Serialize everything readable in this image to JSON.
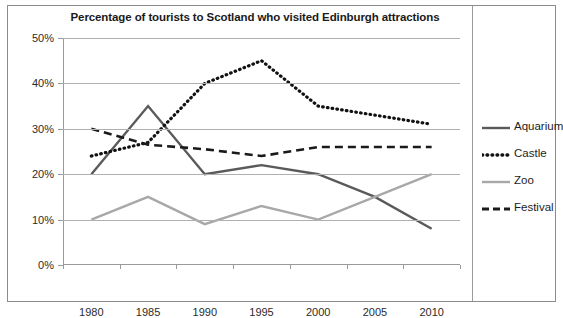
{
  "chart_data": {
    "type": "line",
    "title": "Percentage of tourists to Scotland who visited Edinburgh attractions",
    "xlabel": "",
    "ylabel": "",
    "categories": [
      "1980",
      "1985",
      "1990",
      "1995",
      "2000",
      "2005",
      "2010"
    ],
    "x_tick_labels": [
      "1980",
      "1985",
      "1990",
      "1995",
      "2000",
      "2005",
      "2010"
    ],
    "y_tick_labels": [
      "0%",
      "10%",
      "20%",
      "30%",
      "40%",
      "50%"
    ],
    "y_tick_values": [
      0,
      10,
      20,
      30,
      40,
      50
    ],
    "ylim": [
      0,
      50
    ],
    "grid": "horizontal",
    "legend_position": "right",
    "series": [
      {
        "name": "Aquarium",
        "values": [
          20,
          35,
          20,
          22,
          20,
          15,
          8
        ],
        "color": "#5a5a5a",
        "style": "solid"
      },
      {
        "name": "Castle",
        "values": [
          24,
          27,
          40,
          45,
          35,
          33,
          31
        ],
        "color": "#111111",
        "style": "dotted"
      },
      {
        "name": "Zoo",
        "values": [
          10,
          15,
          9,
          13,
          10,
          15,
          20
        ],
        "color": "#a8a8a8",
        "style": "solid"
      },
      {
        "name": "Festival",
        "values": [
          30,
          26.5,
          25.5,
          24,
          26,
          26,
          26
        ],
        "color": "#1a1a1a",
        "style": "dashed"
      }
    ]
  },
  "legend": {
    "items": [
      {
        "label": "Aquarium"
      },
      {
        "label": "Castle"
      },
      {
        "label": "Zoo"
      },
      {
        "label": "Festival"
      }
    ]
  },
  "colors": {
    "aquarium": "#5a5a5a",
    "castle": "#111111",
    "zoo": "#a8a8a8",
    "festival": "#1a1a1a",
    "gridline": "#b0b0b0",
    "axis": "#9a9a9a",
    "frame": "#8c8c8c",
    "background": "#ffffff"
  }
}
